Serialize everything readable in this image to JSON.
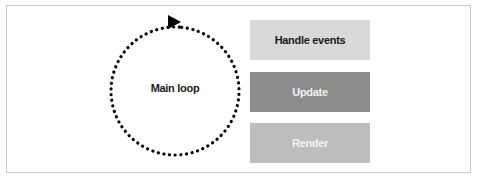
{
  "diagram": {
    "loop": {
      "label": "Main loop",
      "style": "dotted-circle",
      "direction": "clockwise",
      "color": "#000000"
    },
    "steps": [
      {
        "label": "Handle events",
        "fill": "#d9d9d9",
        "text_color": "#1a1a1a"
      },
      {
        "label": "Update",
        "fill": "#8c8c8c",
        "text_color": "#f2f2f2"
      },
      {
        "label": "Render",
        "fill": "#bdbdbd",
        "text_color": "#f2f2f2"
      }
    ],
    "icons": {
      "loop_arrow": "arrowhead-right-icon"
    }
  }
}
